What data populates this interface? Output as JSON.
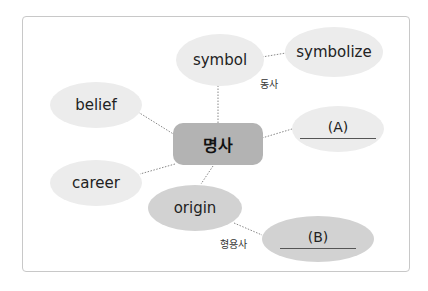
{
  "center": {
    "label": "명사"
  },
  "nodes": {
    "symbol": "symbol",
    "symbolize": "symbolize",
    "belief": "belief",
    "career": "career",
    "origin": "origin",
    "blank_a": "(A)",
    "blank_b": "(B)"
  },
  "tags": {
    "verb": "동사",
    "adjective": "형용사"
  },
  "colors": {
    "center_fill": "#b3b3b3",
    "light_fill": "#ececec",
    "mid_fill": "#d2d2d2",
    "connector": "#888888"
  }
}
